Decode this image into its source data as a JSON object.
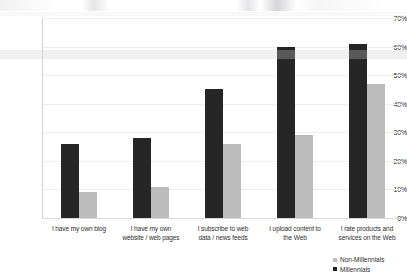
{
  "chart_data": {
    "type": "bar",
    "title": "",
    "xlabel": "",
    "ylabel": "",
    "ylim": [
      0,
      70
    ],
    "ytick_labels": [
      "0%",
      "10%",
      "20%",
      "30%",
      "40%",
      "50%",
      "60%",
      "70%"
    ],
    "ytick_values": [
      0,
      10,
      20,
      30,
      40,
      50,
      60,
      70
    ],
    "grid": true,
    "legend_position": "bottom-right",
    "categories": [
      "I have my own blog",
      "I have my own website / web pages",
      "I subscribe to web data / news feeds",
      "I upload content to the Web",
      "I rate products and services on the Web"
    ],
    "category_lines": [
      [
        "I have my own blog"
      ],
      [
        "I have my own",
        "website / web pages"
      ],
      [
        "I subscribe to web",
        "data / news feeds"
      ],
      [
        "I upload content to",
        "the Web"
      ],
      [
        "I rate products and",
        "services on the Web"
      ]
    ],
    "series": [
      {
        "name": "Millennials",
        "color": "#262626",
        "values": [
          26,
          28,
          45,
          60,
          61
        ]
      },
      {
        "name": "Non-Millennials",
        "color": "#bcbcbc",
        "values": [
          9,
          11,
          26,
          29,
          47
        ]
      }
    ]
  },
  "legend": {
    "items": [
      {
        "label": "Non-Millennials",
        "color": "#bcbcbc"
      },
      {
        "label": "Millennials",
        "color": "#1f1f1f"
      }
    ]
  },
  "colors": {
    "millennials": "#262626",
    "non_millennials": "#bcbcbc",
    "gridline": "#ededed",
    "axis": "#d3d3d3",
    "text": "#2e2e2e",
    "background": "#ffffff"
  }
}
